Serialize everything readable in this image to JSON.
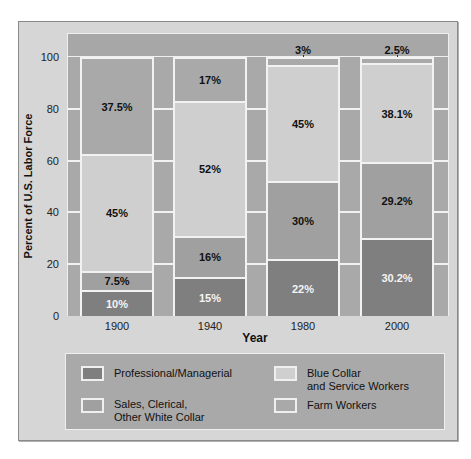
{
  "chart_data": {
    "type": "bar",
    "subtype": "stacked-100",
    "title": "",
    "xlabel": "Year",
    "ylabel": "Percent of U.S. Labor Force",
    "ylim": [
      0,
      100
    ],
    "yticks": [
      "0",
      "20",
      "40",
      "60",
      "80",
      "100"
    ],
    "categories": [
      "1900",
      "1940",
      "1980",
      "2000"
    ],
    "series": [
      {
        "name": "Professional/Managerial",
        "color": "#7f7f7f",
        "values": [
          10,
          15,
          22,
          30.2
        ],
        "labels": [
          "10%",
          "15%",
          "22%",
          "30.2%"
        ]
      },
      {
        "name": "Sales, Clerical, Other White Collar",
        "color": "#a0a0a0",
        "values": [
          7.5,
          16,
          30,
          29.2
        ],
        "labels": [
          "7.5%",
          "16%",
          "30%",
          "29.2%"
        ]
      },
      {
        "name": "Blue Collar and Service Workers",
        "color": "#cfcfcf",
        "values": [
          45,
          52,
          45,
          38.1
        ],
        "labels": [
          "45%",
          "52%",
          "45%",
          "38.1%"
        ]
      },
      {
        "name": "Farm Workers",
        "color": "#a9a9a9",
        "values": [
          37.5,
          17,
          3,
          2.5
        ],
        "labels": [
          "37.5%",
          "17%",
          "3%",
          "2.5%"
        ]
      }
    ],
    "legend_position": "bottom"
  },
  "legend": {
    "professional": "Professional/Managerial",
    "sales_line1": "Sales, Clerical,",
    "sales_line2": "Other White Collar",
    "blue_line1": "Blue Collar",
    "blue_line2": "and Service Workers",
    "farm": "Farm Workers"
  }
}
